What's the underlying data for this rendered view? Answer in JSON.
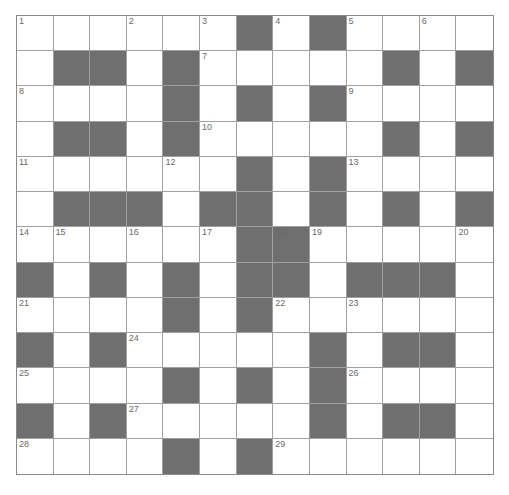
{
  "puzzle": {
    "rows": 13,
    "cols": 13,
    "colors": {
      "block": "#6f6f6f",
      "cell": "#ffffff",
      "grid_line": "#a0a0a0"
    },
    "layout": [
      "......#.#....",
      ".##.#.....#.#",
      "....#.#.#....",
      ".##.#.....#.#",
      "......#.#....",
      ".###.##.#.#.#",
      "......##.....",
      "#.#.#.##.###.",
      "....#.#......",
      "#.#....#.##.",
      "....#.#.#....",
      "#.#....#.##.",
      "....#.#......"
    ],
    "numbers": [
      {
        "r": 0,
        "c": 0,
        "n": "1"
      },
      {
        "r": 0,
        "c": 3,
        "n": "2"
      },
      {
        "r": 0,
        "c": 5,
        "n": "3"
      },
      {
        "r": 0,
        "c": 7,
        "n": "4"
      },
      {
        "r": 0,
        "c": 9,
        "n": "5"
      },
      {
        "r": 0,
        "c": 11,
        "n": "6"
      },
      {
        "r": 1,
        "c": 5,
        "n": "7"
      },
      {
        "r": 2,
        "c": 0,
        "n": "8"
      },
      {
        "r": 2,
        "c": 9,
        "n": "9"
      },
      {
        "r": 3,
        "c": 5,
        "n": "10"
      },
      {
        "r": 4,
        "c": 0,
        "n": "11"
      },
      {
        "r": 4,
        "c": 4,
        "n": "12"
      },
      {
        "r": 4,
        "c": 9,
        "n": "13"
      },
      {
        "r": 6,
        "c": 0,
        "n": "14"
      },
      {
        "r": 6,
        "c": 1,
        "n": "15"
      },
      {
        "r": 6,
        "c": 3,
        "n": "16"
      },
      {
        "r": 6,
        "c": 5,
        "n": "17"
      },
      {
        "r": 6,
        "c": 7,
        "n": "18"
      },
      {
        "r": 6,
        "c": 8,
        "n": "19"
      },
      {
        "r": 6,
        "c": 12,
        "n": "20"
      },
      {
        "r": 8,
        "c": 0,
        "n": "21"
      },
      {
        "r": 8,
        "c": 7,
        "n": "22"
      },
      {
        "r": 8,
        "c": 9,
        "n": "23"
      },
      {
        "r": 9,
        "c": 3,
        "n": "24"
      },
      {
        "r": 10,
        "c": 0,
        "n": "25"
      },
      {
        "r": 10,
        "c": 9,
        "n": "26"
      },
      {
        "r": 11,
        "c": 3,
        "n": "27"
      },
      {
        "r": 12,
        "c": 0,
        "n": "28"
      },
      {
        "r": 12,
        "c": 7,
        "n": "29"
      }
    ]
  }
}
